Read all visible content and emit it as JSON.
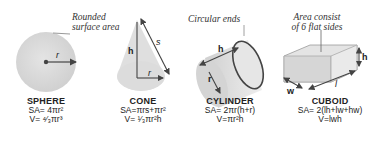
{
  "annotations": {
    "rounded": [
      "Rounded",
      "surface area"
    ],
    "circular": "Circular ends",
    "area": [
      "Area consist",
      "of 6 flat sides"
    ]
  },
  "shapes": [
    {
      "name": "SPHERE",
      "sa": "SA= 4πr²",
      "v": "V= ⁴⁄₃πr³",
      "vars": {
        "r": "r"
      }
    },
    {
      "name": "CONE",
      "sa": "SA=πrs+πr²",
      "v": "V= ¹⁄₃πr²h",
      "vars": {
        "h": "h",
        "r": "r",
        "s": "s"
      }
    },
    {
      "name": "CYLINDER",
      "sa": "SA= 2πr(h+r)",
      "v": "V=πr²h",
      "vars": {
        "h": "h",
        "r": "r"
      }
    },
    {
      "name": "CUBOID",
      "sa": "SA= 2(lh+lw+hw)",
      "v": "V=lwh",
      "vars": {
        "h": "h",
        "w": "w",
        "l": "l"
      }
    }
  ],
  "colors": {
    "shape_fill": "#d9d9d9",
    "stroke": "#444444",
    "background": "#ffffff"
  }
}
